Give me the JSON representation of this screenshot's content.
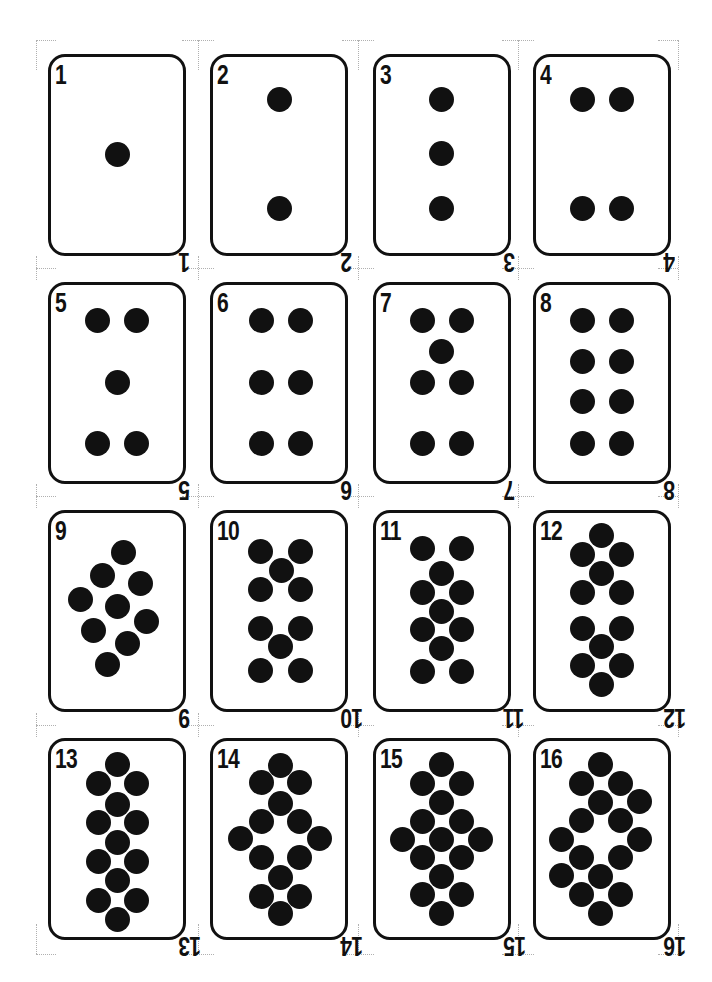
{
  "sheet": {
    "title": "Numbered pip cards 1-16",
    "colors": {
      "ink": "#111111",
      "paper": "#ffffff",
      "crop_marks": "#b0b0b0"
    },
    "columns_x": [
      48,
      210,
      373,
      533
    ],
    "rows_y": [
      54,
      282,
      510,
      738
    ],
    "card_width": 138,
    "card_height": 202,
    "cards": [
      {
        "label": "1",
        "pips": [
          [
            117,
            154
          ]
        ]
      },
      {
        "label": "2",
        "pips": [
          [
            279,
            99
          ],
          [
            279,
            208
          ]
        ]
      },
      {
        "label": "3",
        "pips": [
          [
            441,
            99
          ],
          [
            441,
            153
          ],
          [
            441,
            208
          ]
        ]
      },
      {
        "label": "4",
        "pips": [
          [
            582,
            99
          ],
          [
            621,
            99
          ],
          [
            582,
            208
          ],
          [
            621,
            208
          ]
        ]
      },
      {
        "label": "5",
        "pips": [
          [
            97,
            320
          ],
          [
            136,
            320
          ],
          [
            117,
            382
          ],
          [
            97,
            443
          ],
          [
            136,
            443
          ]
        ]
      },
      {
        "label": "6",
        "pips": [
          [
            261,
            320
          ],
          [
            300,
            320
          ],
          [
            261,
            382
          ],
          [
            300,
            382
          ],
          [
            261,
            443
          ],
          [
            300,
            443
          ]
        ]
      },
      {
        "label": "7",
        "pips": [
          [
            422,
            320
          ],
          [
            461,
            320
          ],
          [
            441,
            351
          ],
          [
            422,
            382
          ],
          [
            461,
            382
          ],
          [
            422,
            443
          ],
          [
            461,
            443
          ]
        ]
      },
      {
        "label": "8",
        "pips": [
          [
            582,
            320
          ],
          [
            621,
            320
          ],
          [
            582,
            361
          ],
          [
            621,
            361
          ],
          [
            582,
            401
          ],
          [
            621,
            401
          ],
          [
            582,
            443
          ],
          [
            621,
            443
          ]
        ]
      },
      {
        "label": "9",
        "pips": [
          [
            123,
            552
          ],
          [
            102,
            575
          ],
          [
            140,
            583
          ],
          [
            80,
            599
          ],
          [
            117,
            606
          ],
          [
            146,
            621
          ],
          [
            93,
            630
          ],
          [
            127,
            643
          ],
          [
            107,
            664
          ]
        ]
      },
      {
        "label": "10",
        "pips": [
          [
            260,
            551
          ],
          [
            300,
            551
          ],
          [
            281,
            570
          ],
          [
            260,
            589
          ],
          [
            300,
            589
          ],
          [
            260,
            628
          ],
          [
            300,
            628
          ],
          [
            280,
            646
          ],
          [
            260,
            670
          ],
          [
            300,
            670
          ]
        ]
      },
      {
        "label": "11",
        "pips": [
          [
            422,
            548
          ],
          [
            461,
            548
          ],
          [
            441,
            573
          ],
          [
            422,
            592
          ],
          [
            461,
            592
          ],
          [
            441,
            611
          ],
          [
            422,
            629
          ],
          [
            461,
            629
          ],
          [
            441,
            648
          ],
          [
            422,
            671
          ],
          [
            461,
            671
          ]
        ]
      },
      {
        "label": "12",
        "pips": [
          [
            601,
            535
          ],
          [
            582,
            554
          ],
          [
            621,
            554
          ],
          [
            601,
            573
          ],
          [
            582,
            592
          ],
          [
            621,
            592
          ],
          [
            582,
            628
          ],
          [
            621,
            628
          ],
          [
            601,
            646
          ],
          [
            582,
            665
          ],
          [
            621,
            665
          ],
          [
            601,
            684
          ]
        ]
      },
      {
        "label": "13",
        "pips": [
          [
            117,
            764
          ],
          [
            98,
            783
          ],
          [
            136,
            783
          ],
          [
            117,
            804
          ],
          [
            98,
            822
          ],
          [
            136,
            822
          ],
          [
            117,
            842
          ],
          [
            98,
            861
          ],
          [
            136,
            861
          ],
          [
            117,
            880
          ],
          [
            98,
            900
          ],
          [
            136,
            900
          ],
          [
            117,
            919
          ]
        ]
      },
      {
        "label": "14",
        "pips": [
          [
            280,
            765
          ],
          [
            261,
            782
          ],
          [
            299,
            782
          ],
          [
            280,
            803
          ],
          [
            261,
            821
          ],
          [
            299,
            821
          ],
          [
            240,
            838
          ],
          [
            319,
            838
          ],
          [
            261,
            857
          ],
          [
            299,
            857
          ],
          [
            280,
            877
          ],
          [
            261,
            896
          ],
          [
            299,
            896
          ],
          [
            280,
            913
          ]
        ]
      },
      {
        "label": "15",
        "pips": [
          [
            441,
            764
          ],
          [
            422,
            783
          ],
          [
            461,
            783
          ],
          [
            441,
            802
          ],
          [
            422,
            821
          ],
          [
            461,
            821
          ],
          [
            402,
            839
          ],
          [
            441,
            839
          ],
          [
            480,
            839
          ],
          [
            422,
            857
          ],
          [
            461,
            857
          ],
          [
            441,
            876
          ],
          [
            422,
            894
          ],
          [
            461,
            894
          ],
          [
            441,
            913
          ]
        ]
      },
      {
        "label": "16",
        "pips": [
          [
            600,
            764
          ],
          [
            581,
            783
          ],
          [
            620,
            783
          ],
          [
            600,
            802
          ],
          [
            639,
            801
          ],
          [
            581,
            820
          ],
          [
            620,
            820
          ],
          [
            561,
            839
          ],
          [
            639,
            839
          ],
          [
            581,
            857
          ],
          [
            620,
            857
          ],
          [
            561,
            875
          ],
          [
            600,
            876
          ],
          [
            581,
            894
          ],
          [
            620,
            894
          ],
          [
            600,
            913
          ]
        ]
      }
    ]
  }
}
